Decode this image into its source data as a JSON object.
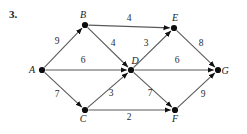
{
  "figure": {
    "problem_number": "3.",
    "caption": "",
    "type": "directed-weighted-graph"
  },
  "graph_data": {
    "type": "diagram",
    "directed": true,
    "weighted": true,
    "nodes": [
      {
        "id": "A",
        "label": "A",
        "x": 42,
        "y": 70,
        "label_dx": -10,
        "label_dy": 3
      },
      {
        "id": "B",
        "label": "B",
        "x": 85,
        "y": 25,
        "label_dx": -2,
        "label_dy": -7
      },
      {
        "id": "C",
        "label": "C",
        "x": 85,
        "y": 110,
        "label_dx": -2,
        "label_dy": 12
      },
      {
        "id": "D",
        "label": "D",
        "x": 131,
        "y": 70,
        "label_dx": 4,
        "label_dy": -6
      },
      {
        "id": "E",
        "label": "E",
        "x": 174,
        "y": 28,
        "label_dx": 1,
        "label_dy": -7
      },
      {
        "id": "F",
        "label": "F",
        "x": 175,
        "y": 110,
        "label_dx": 0,
        "label_dy": 12
      },
      {
        "id": "G",
        "label": "G",
        "x": 218,
        "y": 70,
        "label_dx": 7,
        "label_dy": 4
      }
    ],
    "edges": [
      {
        "from": "A",
        "to": "B",
        "weight": "9",
        "wx": 57,
        "wy": 44
      },
      {
        "from": "A",
        "to": "D",
        "weight": "6",
        "wx": 83,
        "wy": 63
      },
      {
        "from": "A",
        "to": "C",
        "weight": "7",
        "wx": 57,
        "wy": 97
      },
      {
        "from": "B",
        "to": "E",
        "weight": "4",
        "wx": 129,
        "wy": 21
      },
      {
        "from": "B",
        "to": "D",
        "weight": "4",
        "wx": 113,
        "wy": 46
      },
      {
        "from": "C",
        "to": "D",
        "weight": "3",
        "wx": 111,
        "wy": 96
      },
      {
        "from": "C",
        "to": "F",
        "weight": "2",
        "wx": 129,
        "wy": 120
      },
      {
        "from": "D",
        "to": "E",
        "weight": "3",
        "wx": 146,
        "wy": 46
      },
      {
        "from": "D",
        "to": "G",
        "weight": "6",
        "wx": 177,
        "wy": 63
      },
      {
        "from": "D",
        "to": "F",
        "weight": "7",
        "wx": 150,
        "wy": 96
      },
      {
        "from": "E",
        "to": "G",
        "weight": "8",
        "wx": 201,
        "wy": 46
      },
      {
        "from": "F",
        "to": "G",
        "weight": "9",
        "wx": 203,
        "wy": 97
      }
    ],
    "node_radius": 3.1,
    "colors": {
      "node": "#0d0d0d",
      "edge": "#5a5a5a",
      "text": "#1a1a1a"
    }
  }
}
